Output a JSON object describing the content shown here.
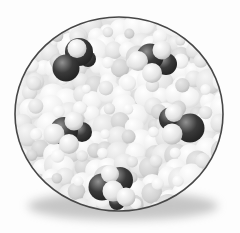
{
  "illustration": {
    "kind": "magnified-molecular-view",
    "canvas": {
      "width": 240,
      "height": 233,
      "background": "#fdfdfd"
    },
    "lens": {
      "cx": 119,
      "cy": 114,
      "rx": 104,
      "ry": 97,
      "outline_color": "#474747",
      "outline_width": 1.6,
      "interior_color": "#e3e3e3"
    },
    "shadow": {
      "cx": 123,
      "cy": 206,
      "rx": 95,
      "ry": 14,
      "color": "#8f8f8f",
      "opacity": 0.5,
      "blur": 5
    },
    "vignette": {
      "stops": [
        [
          "0%",
          "rgba(255,255,255,0)"
        ],
        [
          "72%",
          "rgba(255,255,255,0)"
        ],
        [
          "100%",
          "rgba(80,80,80,0.22)"
        ]
      ]
    },
    "solvent": {
      "seed": 13,
      "grid_step": 14,
      "jitter": 10,
      "radius_min": 7.5,
      "radius_max": 13,
      "extra_pass_step": 24,
      "extra_radius_min": 4.5,
      "extra_radius_max": 8,
      "shades": [
        {
          "weight": 0.45,
          "stops": [
            [
              "0%",
              "#ffffff"
            ],
            [
              "65%",
              "#efefef"
            ],
            [
              "100%",
              "#cfcfcf"
            ]
          ]
        },
        {
          "weight": 0.35,
          "stops": [
            [
              "0%",
              "#f6f6f6"
            ],
            [
              "60%",
              "#e2e2e2"
            ],
            [
              "100%",
              "#bfbfbf"
            ]
          ]
        },
        {
          "weight": 0.2,
          "stops": [
            [
              "0%",
              "#e8e8e8"
            ],
            [
              "60%",
              "#d2d2d2"
            ],
            [
              "100%",
              "#b0b0b0"
            ]
          ]
        }
      ]
    },
    "atoms": {
      "dark": {
        "stops": [
          [
            "0%",
            "#929292"
          ],
          [
            "45%",
            "#3a3a3a"
          ],
          [
            "100%",
            "#1b1b1b"
          ]
        ]
      },
      "light": {
        "stops": [
          [
            "0%",
            "#ffffff"
          ],
          [
            "60%",
            "#e3e3e3"
          ],
          [
            "100%",
            "#a6a6a6"
          ]
        ]
      }
    },
    "molecules": [
      {
        "id": "molecule-1",
        "atoms": [
          {
            "x": 88,
            "y": 59,
            "r": 8,
            "shade": "dark"
          },
          {
            "x": 79,
            "y": 52,
            "r": 14,
            "shade": "dark"
          },
          {
            "x": 66,
            "y": 68,
            "r": 13.5,
            "shade": "dark"
          },
          {
            "x": 77,
            "y": 48.5,
            "r": 9.5,
            "shade": "light"
          }
        ]
      },
      {
        "id": "molecule-2",
        "atoms": [
          {
            "x": 166,
            "y": 64,
            "r": 11,
            "shade": "dark"
          },
          {
            "x": 150,
            "y": 57,
            "r": 13.5,
            "shade": "dark"
          },
          {
            "x": 162,
            "y": 50,
            "r": 9.5,
            "shade": "light"
          },
          {
            "x": 138,
            "y": 61,
            "r": 10,
            "shade": "light"
          },
          {
            "x": 152,
            "y": 73,
            "r": 10,
            "shade": "light"
          }
        ]
      },
      {
        "id": "molecule-3",
        "atoms": [
          {
            "x": 82,
            "y": 132,
            "r": 10,
            "shade": "dark"
          },
          {
            "x": 64,
            "y": 131,
            "r": 14,
            "shade": "dark"
          },
          {
            "x": 74,
            "y": 121,
            "r": 9.5,
            "shade": "light"
          },
          {
            "x": 54,
            "y": 134,
            "r": 10.5,
            "shade": "light"
          },
          {
            "x": 69,
            "y": 144,
            "r": 10,
            "shade": "light"
          }
        ]
      },
      {
        "id": "molecule-4",
        "atoms": [
          {
            "x": 171,
            "y": 119,
            "r": 12,
            "shade": "dark"
          },
          {
            "x": 190,
            "y": 128,
            "r": 14.5,
            "shade": "dark"
          },
          {
            "x": 174,
            "y": 113,
            "r": 9,
            "shade": "light"
          },
          {
            "x": 172,
            "y": 134,
            "r": 10.5,
            "shade": "light"
          }
        ]
      },
      {
        "id": "molecule-5",
        "atoms": [
          {
            "x": 117,
            "y": 202,
            "r": 8,
            "shade": "dark"
          },
          {
            "x": 120,
            "y": 180,
            "r": 13,
            "shade": "dark"
          },
          {
            "x": 102,
            "y": 187,
            "r": 13.5,
            "shade": "dark"
          },
          {
            "x": 110,
            "y": 174,
            "r": 9,
            "shade": "light"
          },
          {
            "x": 113,
            "y": 191,
            "r": 10.5,
            "shade": "light"
          },
          {
            "x": 126,
            "y": 197,
            "r": 9.5,
            "shade": "light"
          }
        ]
      }
    ]
  }
}
